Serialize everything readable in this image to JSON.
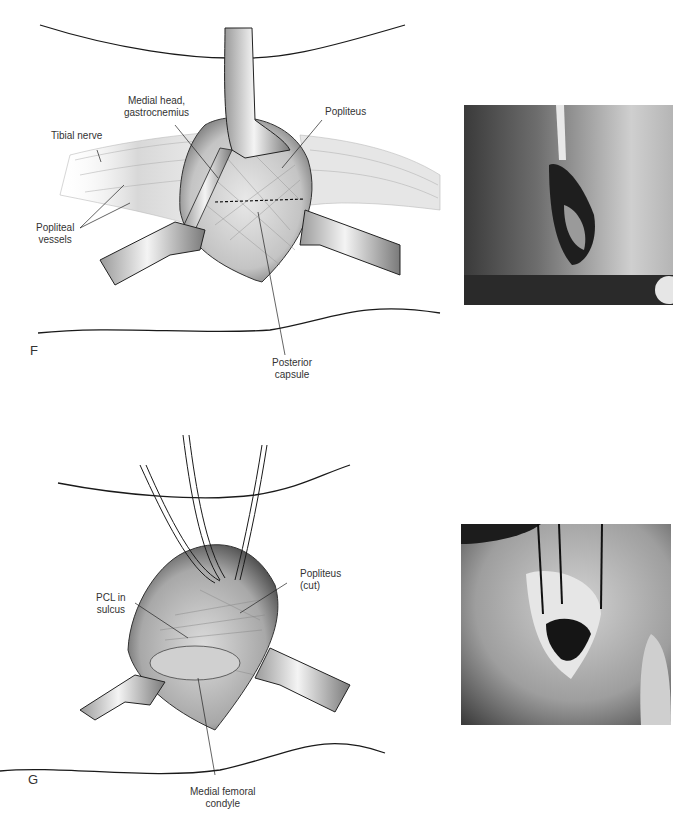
{
  "figure": {
    "panels": [
      {
        "letter": "F",
        "labels": {
          "medial_head_line1": "Medial head,",
          "medial_head_line2": "gastrocnemius",
          "popliteus": "Popliteus",
          "tibial_nerve": "Tibial nerve",
          "popliteal_vessels_line1": "Popliteal",
          "popliteal_vessels_line2": "vessels",
          "posterior_capsule_line1": "Posterior",
          "posterior_capsule_line2": "capsule"
        },
        "photo": "intraoperative-photo-posterior-capsule-exposure"
      },
      {
        "letter": "G",
        "labels": {
          "pcl_line1": "PCL in",
          "pcl_line2": "sulcus",
          "popliteus_cut_line1": "Popliteus",
          "popliteus_cut_line2": "(cut)",
          "condyle_line1": "Medial femoral",
          "condyle_line2": "condyle"
        },
        "photo": "intraoperative-photo-pcl-exposure"
      }
    ],
    "colors": {
      "line": "#1a1a1a",
      "skin": "#ffffff",
      "tissue_light": "#e2e2e2",
      "tissue_mid": "#bdbdbd",
      "tissue_dark": "#5a5a5a",
      "photo_dark": "#2b2b2b",
      "photo_light": "#c9c9c9"
    }
  }
}
